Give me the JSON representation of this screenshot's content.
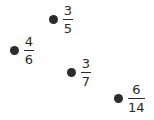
{
  "points": [
    {
      "numerator": "3",
      "denominator": "5",
      "x": 49,
      "y": 4
    },
    {
      "numerator": "4",
      "denominator": "6",
      "x": 10,
      "y": 35
    },
    {
      "numerator": "3",
      "denominator": "7",
      "x": 67,
      "y": 57
    },
    {
      "numerator": "6",
      "denominator": "14",
      "x": 114,
      "y": 83
    }
  ]
}
